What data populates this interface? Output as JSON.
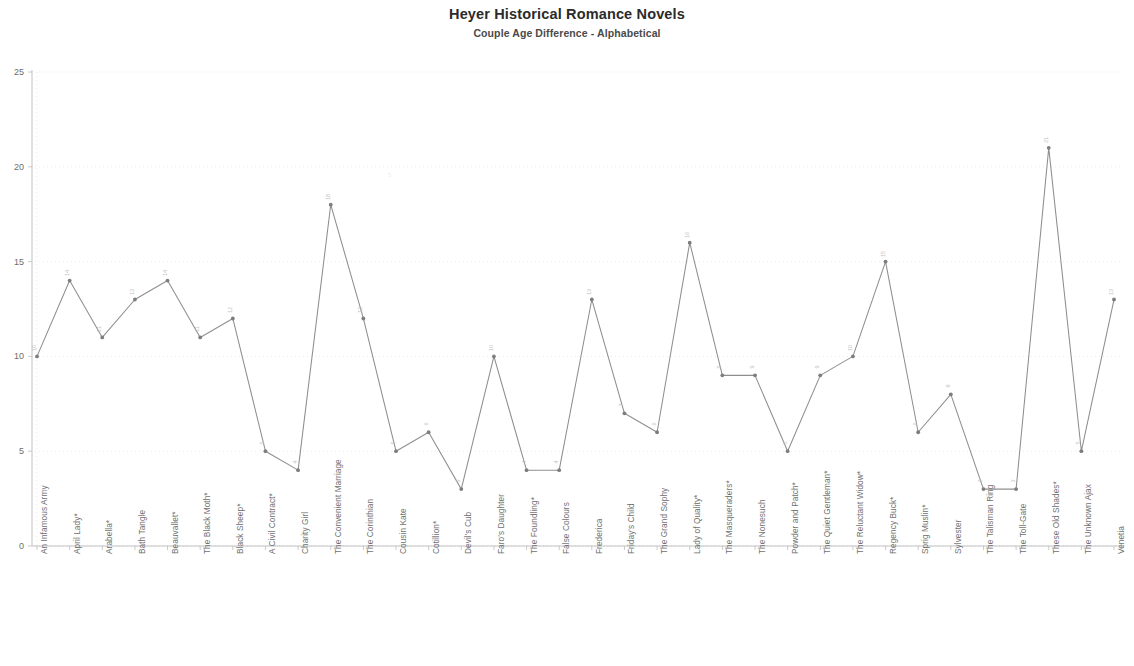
{
  "header": {
    "title": "Heyer Historical Romance Novels",
    "subtitle": "Couple Age Difference - Alphabetical"
  },
  "axes": {
    "y_ticks": [
      "0",
      "5",
      "10",
      "15",
      "20",
      "25"
    ],
    "y_min": 0,
    "y_max": 25,
    "y_step": 5
  },
  "chart_data": {
    "type": "line",
    "title": "Heyer Historical Romance Novels",
    "subtitle": "Couple Age Difference - Alphabetical",
    "xlabel": "",
    "ylabel": "",
    "ylim": [
      0,
      25
    ],
    "ytick_step": 5,
    "grid": true,
    "legend": false,
    "markers": true,
    "point_labels": true,
    "categories": [
      "An Infamous Army",
      "April Lady*",
      "Arabella*",
      "Bath Tangle",
      "Beauvallet*",
      "The Black Moth*",
      "Black Sheep*",
      "A Civil Contract*",
      "Charity Girl",
      "The Convenient Marriage",
      "The Corinthian",
      "Cousin Kate",
      "Cotillion*",
      "Devil's Cub",
      "Faro's Daughter",
      "The Foundling*",
      "False Colours",
      "Frederica",
      "Friday's Child",
      "The Grand Sophy",
      "Lady of Quality*",
      "The Masqueraders*",
      "The Nonesuch",
      "Powder and Patch*",
      "The Quiet Gentleman*",
      "The Reluctant Widow*",
      "Regency Buck*",
      "Sprig Muslin*",
      "Sylvester",
      "The Talisman Ring",
      "The Toll-Gate",
      "These Old Shades*",
      "The Unknown Ajax",
      "Venetia"
    ],
    "values": [
      10,
      14,
      11,
      13,
      14,
      11,
      12,
      5,
      4,
      18,
      12,
      5,
      6,
      3,
      10,
      4,
      4,
      13,
      7,
      6,
      16,
      9,
      9,
      5,
      9,
      10,
      15,
      6,
      8,
      3,
      3,
      21,
      5,
      13
    ],
    "series": [
      {
        "name": "Couple Age Difference",
        "values": [
          10,
          14,
          11,
          13,
          14,
          11,
          12,
          5,
          4,
          18,
          12,
          5,
          6,
          3,
          10,
          4,
          4,
          13,
          7,
          6,
          16,
          9,
          9,
          5,
          9,
          10,
          15,
          6,
          8,
          3,
          3,
          21,
          5,
          13
        ]
      }
    ]
  },
  "colors": {
    "line": "#8e8e8e",
    "marker": "#7d7d7d",
    "grid": "#e2e2e2",
    "axis": "#b9b9b9",
    "title": "#2b2b2b",
    "tick_text": "#6d6d6d"
  }
}
